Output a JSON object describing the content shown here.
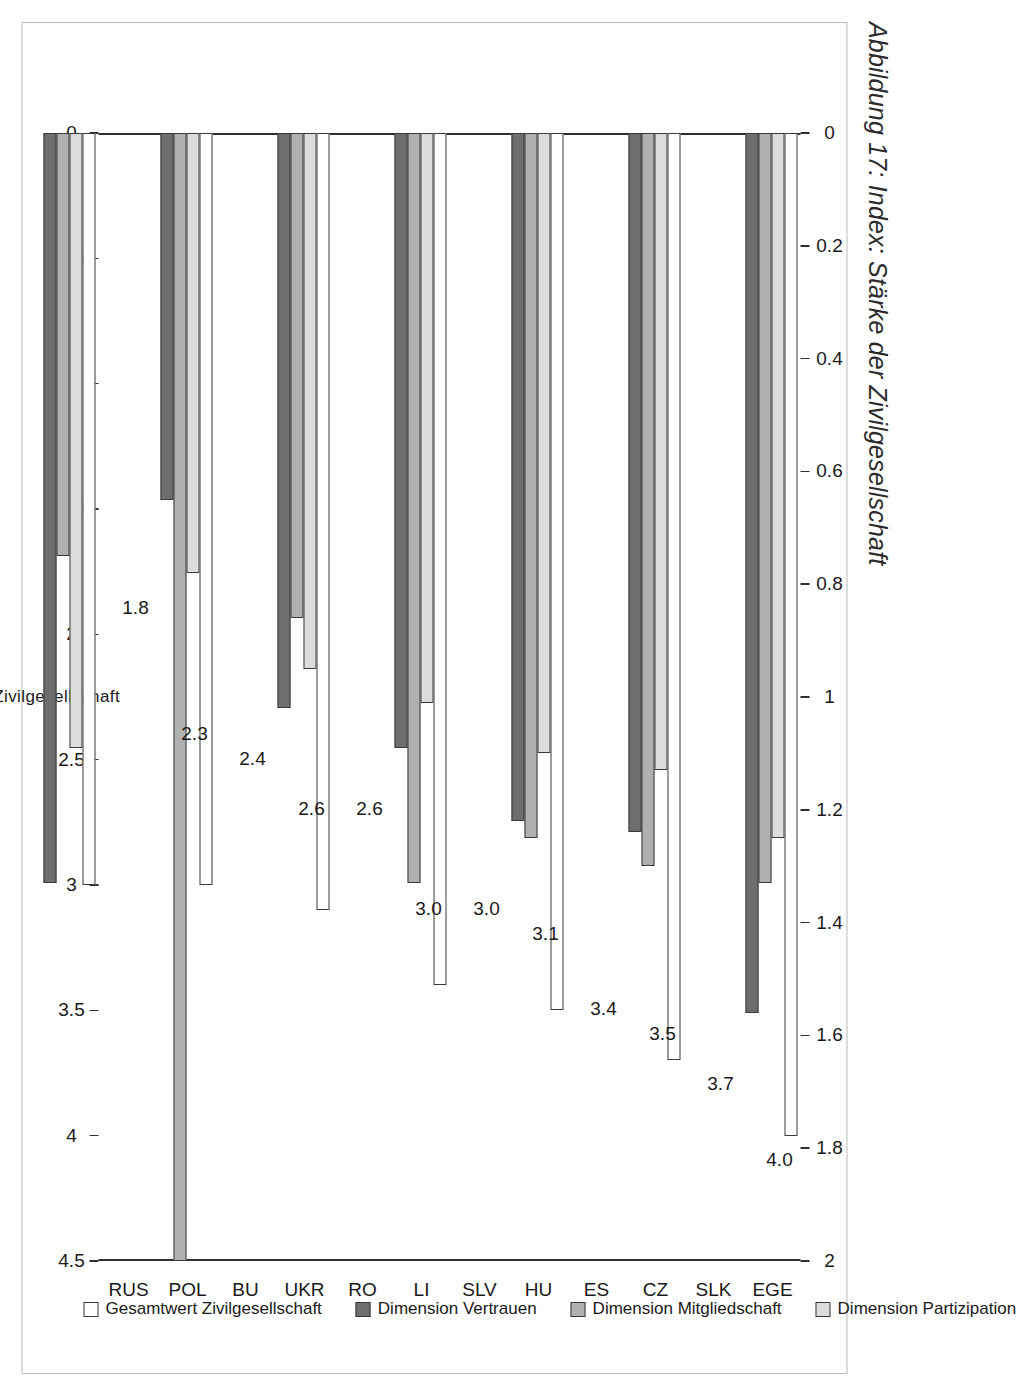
{
  "figure": {
    "title": "Abbildung 17: Index: Stärke der Zivilgesellschaft",
    "y_axis_title": "Gesamtwert Zivilgesellschaft"
  },
  "legend": {
    "position": "bottom",
    "items": [
      {
        "label": "Gesamtwert Zivilgesellschaft",
        "color": "#ffffff",
        "key": "total"
      },
      {
        "label": "Dimension Vertrauen",
        "color": "#6e6e6e",
        "key": "vertrauen"
      },
      {
        "label": "Dimension Mitgliedschaft",
        "color": "#b0b0b0",
        "key": "mitgliedschaft"
      },
      {
        "label": "Dimension Partizipation",
        "color": "#dcdcdc",
        "key": "partizipation"
      }
    ]
  },
  "chart_data": {
    "type": "bar",
    "orientation": "horizontal",
    "title": "Abbildung 17: Index: Stärke der Zivilgesellschaft",
    "xlabel": "",
    "ylabel": "Gesamtwert Zivilgesellschaft",
    "grid": false,
    "categories": [
      "EGE",
      "SLK",
      "CZ",
      "ES",
      "HU",
      "SLV",
      "LI",
      "RO",
      "UKR",
      "BU",
      "POL",
      "RUS"
    ],
    "primary_axis": {
      "name": "Gesamtwert Zivilgesellschaft",
      "ticks": [
        "0",
        "0.5",
        "1",
        "1.5",
        "2",
        "2.5",
        "3",
        "3.5",
        "4",
        "4.5"
      ],
      "tick_values": [
        0,
        0.5,
        1,
        1.5,
        2,
        2.5,
        3,
        3.5,
        4,
        4.5
      ],
      "lim": [
        0,
        4.5
      ],
      "applies_to": [
        "total"
      ]
    },
    "secondary_axis": {
      "name": "Dimensionen",
      "ticks": [
        "0",
        "0.2",
        "0.4",
        "0.6",
        "0.8",
        "1",
        "1.2",
        "1.4",
        "1.6",
        "1.8",
        "2"
      ],
      "tick_values": [
        0,
        0.2,
        0.4,
        0.6,
        0.8,
        1.0,
        1.2,
        1.4,
        1.6,
        1.8,
        2.0
      ],
      "lim": [
        0,
        2
      ],
      "applies_to": [
        "vertrauen",
        "mitgliedschaft",
        "partizipation"
      ]
    },
    "series": [
      {
        "name": "Gesamtwert Zivilgesellschaft",
        "axis": "primary",
        "color": "#ffffff",
        "values": [
          4.0,
          3.7,
          3.5,
          3.4,
          3.1,
          3.0,
          3.0,
          2.6,
          2.6,
          2.4,
          2.3,
          1.8
        ]
      },
      {
        "name": "Dimension Vertrauen",
        "axis": "secondary",
        "color": "#6e6e6e",
        "values": [
          1.56,
          1.24,
          1.22,
          1.09,
          1.02,
          0.65,
          1.33,
          1.1,
          1.14,
          1.95,
          1.33,
          0.31
        ]
      },
      {
        "name": "Dimension Mitgliedschaft",
        "axis": "secondary",
        "color": "#b0b0b0",
        "values": [
          1.33,
          1.3,
          1.25,
          1.33,
          0.86,
          2.0,
          0.75,
          1.07,
          1.17,
          0.69,
          0.82,
          0.72
        ]
      },
      {
        "name": "Dimension Partizipation",
        "axis": "secondary",
        "color": "#dcdcdc",
        "values": [
          1.25,
          1.13,
          1.1,
          1.01,
          0.95,
          0.78,
          1.09,
          1.04,
          0.97,
          0.55,
          0.94,
          0.66
        ]
      }
    ],
    "data_labels": [
      "4.0",
      "3.7",
      "3.5",
      "3.4",
      "3.1",
      "3.0",
      "3.0",
      "2.6",
      "2.6",
      "2.4",
      "2.3",
      "1.8"
    ]
  }
}
